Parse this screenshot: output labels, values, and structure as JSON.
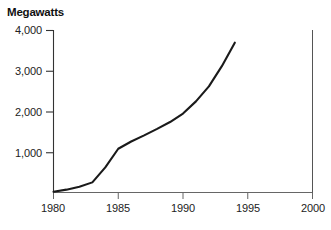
{
  "chart_data": {
    "type": "line",
    "title": "Megawatts",
    "xlabel": "",
    "ylabel": "Megawatts",
    "xlim": [
      1980,
      2000
    ],
    "ylim": [
      0,
      4000
    ],
    "grid": false,
    "legend": null,
    "x_ticks": [
      "1980",
      "1985",
      "1990",
      "1995",
      "2000"
    ],
    "x_tick_values": [
      1980,
      1985,
      1990,
      1995,
      2000
    ],
    "y_ticks": [
      "1,000",
      "2,000",
      "3,000",
      "4,000"
    ],
    "y_tick_values": [
      1000,
      2000,
      3000,
      4000
    ],
    "series": [
      {
        "name": "Megawatts",
        "color": "#1a1a1a",
        "x": [
          1980,
          1981,
          1982,
          1983,
          1984,
          1985,
          1986,
          1987,
          1988,
          1989,
          1990,
          1991,
          1992,
          1993,
          1994
        ],
        "values": [
          20,
          70,
          140,
          250,
          620,
          1080,
          1260,
          1410,
          1570,
          1740,
          1950,
          2250,
          2620,
          3120,
          3700
        ]
      }
    ]
  },
  "axes": {
    "y_axis_color": "#333333",
    "x_axis_color": "#555555",
    "right_spine_color": "#555555"
  }
}
